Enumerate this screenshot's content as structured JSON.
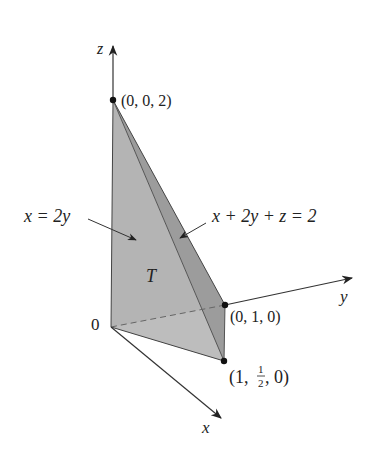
{
  "figure": {
    "axes": {
      "z_label": "z",
      "y_label": "y",
      "x_label": "x",
      "origin_label": "0"
    },
    "points": {
      "top": "(0, 0, 2)",
      "y_point": "(0, 1, 0)",
      "xy_point_prefix": "(1, ",
      "xy_point_frac_num": "1",
      "xy_point_frac_den": "2",
      "xy_point_suffix": ", 0)"
    },
    "labels": {
      "left_plane": "x = 2y",
      "front_plane": "x + 2y + z = 2",
      "solid": "T"
    },
    "colors": {
      "left_face": "#b4b4b4",
      "front_face": "#9c9c9c",
      "bottom_face": "#bdbdbd",
      "line": "#333333",
      "point": "#111111"
    }
  }
}
